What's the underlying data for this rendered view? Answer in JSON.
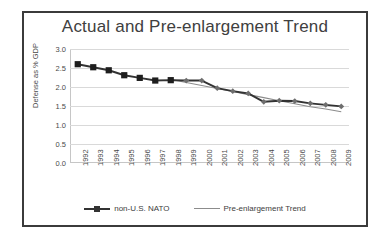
{
  "chart_data": {
    "type": "line",
    "title": "Actual and Pre-enlargement Trend",
    "xlabel": "",
    "ylabel": "Defense as % GDP",
    "categories": [
      "1992",
      "1993",
      "1994",
      "1995",
      "1996",
      "1997",
      "1998",
      "1999",
      "2000",
      "2001",
      "2002",
      "2003",
      "2004",
      "2005",
      "2006",
      "2007",
      "2008",
      "2009"
    ],
    "ylim": [
      0.0,
      3.0
    ],
    "yticks": [
      "0.0",
      "0.5",
      "1.0",
      "1.5",
      "2.0",
      "2.5",
      "3.0"
    ],
    "ytick_values": [
      0.0,
      0.5,
      1.0,
      1.5,
      2.0,
      2.5,
      3.0
    ],
    "grid": true,
    "legend_position": "bottom",
    "series": [
      {
        "name": "non-U.S. NATO",
        "color": "#333333",
        "marker": "square",
        "values": [
          2.6,
          2.52,
          2.44,
          2.31,
          2.24,
          2.17,
          2.18,
          2.17,
          2.17,
          1.97,
          1.89,
          1.83,
          1.61,
          1.64,
          1.63,
          1.57,
          1.53,
          1.49
        ]
      },
      {
        "name": "Pre-enlargement Trend",
        "color": "#8c8c8c",
        "marker": "none",
        "values": [
          null,
          null,
          null,
          null,
          null,
          null,
          2.2,
          2.12,
          2.04,
          1.96,
          1.88,
          1.8,
          1.72,
          1.64,
          1.56,
          1.48,
          1.42,
          1.35
        ]
      }
    ]
  },
  "legend": {
    "entries": [
      {
        "label": "non-U.S. NATO"
      },
      {
        "label": "Pre-enlargement Trend"
      }
    ]
  }
}
